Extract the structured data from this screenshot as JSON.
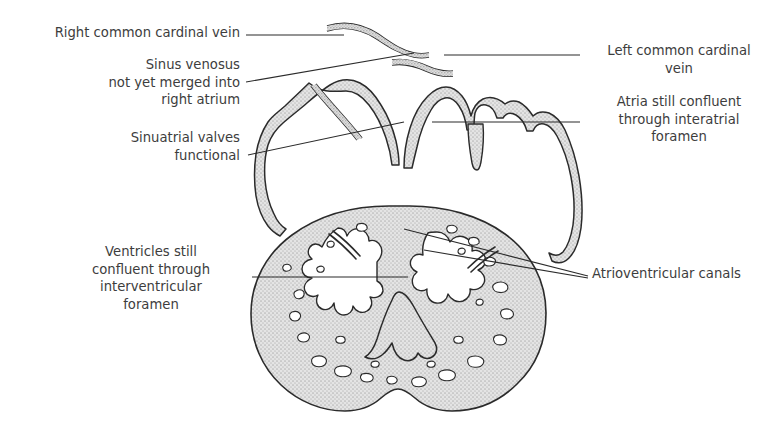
{
  "figure": {
    "background_color": "#ffffff",
    "ink_color": "#2b2b2b",
    "text_color": "#3d3d3d",
    "myocardium_fill": "#dcdcdc",
    "lumen_fill": "#ffffff"
  },
  "labels": {
    "right_common_cardinal_vein": "Right common cardinal vein",
    "sinus_venosus": "Sinus venosus\nnot yet merged into\nright atrium",
    "sinuatrial_valves": "Sinuatrial valves\nfunctional",
    "ventricles": "Ventricles still\nconfluent through\ninterventricular\nforamen",
    "left_common_cardinal_vein": "Left common cardinal\nvein",
    "atria": "Atria still confluent\nthrough interatrial\nforamen",
    "atrioventricular_canals": "Atrioventricular canals"
  }
}
